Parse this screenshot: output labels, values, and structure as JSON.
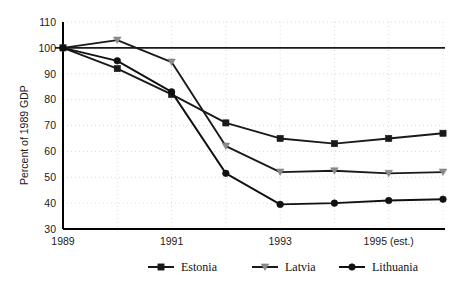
{
  "chart_data": {
    "type": "line",
    "title": "",
    "xlabel": "",
    "ylabel": "Percent of 1989 GDP",
    "x": [
      1989,
      1990,
      1991,
      1992,
      1993,
      1994,
      1995,
      1996
    ],
    "xtick_labels": [
      "1989",
      "1991",
      "1993",
      "1995 (est.)"
    ],
    "xtick_values": [
      1989,
      1991,
      1993,
      1995
    ],
    "ytick_labels": [
      "30",
      "40",
      "50",
      "60",
      "70",
      "80",
      "90",
      "100",
      "110"
    ],
    "ytick_values": [
      30,
      40,
      50,
      60,
      70,
      80,
      90,
      100,
      110
    ],
    "ylim": [
      30,
      110
    ],
    "xlim": [
      1989,
      1996
    ],
    "grid": true,
    "reference_line": {
      "value": 100,
      "label": "100 percent of 1989 GDP"
    },
    "legend_position": "bottom",
    "series": [
      {
        "name": "Estonia",
        "marker": "square",
        "color": "#1a1a1a",
        "values": [
          100,
          92,
          82,
          71,
          65,
          63,
          65,
          67
        ]
      },
      {
        "name": "Latvia",
        "marker": "triangle-down",
        "color": "#8c8c8c",
        "line_color": "#1a1a1a",
        "values": [
          100,
          103,
          94.5,
          62,
          52,
          52.5,
          51.5,
          52
        ]
      },
      {
        "name": "Lithuania",
        "marker": "circle",
        "color": "#111111",
        "values": [
          100,
          95,
          83,
          51.5,
          39.5,
          40,
          41,
          41.5
        ]
      }
    ]
  },
  "legend": {
    "items": [
      {
        "label": "Estonia"
      },
      {
        "label": "Latvia"
      },
      {
        "label": "Lithuania"
      }
    ]
  },
  "axes": {
    "y_title": "Percent of 1989 GDP",
    "y_labels": [
      "110",
      "100",
      "90",
      "80",
      "70",
      "60",
      "50",
      "40",
      "30"
    ],
    "x_labels": [
      "1989",
      "1991",
      "1993",
      "1995 (est.)"
    ]
  }
}
